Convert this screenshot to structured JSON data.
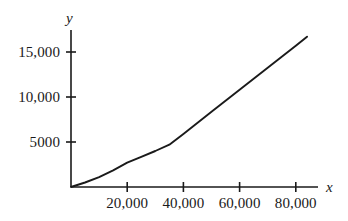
{
  "chart_data": {
    "type": "line",
    "title": "",
    "subtitle": "",
    "xlabel": "x",
    "ylabel": "y",
    "xlim": [
      0,
      88000
    ],
    "ylim": [
      0,
      18000
    ],
    "grid": false,
    "legend": null,
    "axis_labels": {
      "x": "x",
      "y": "y"
    },
    "xticks": [
      {
        "value": 20000,
        "label": "20,000"
      },
      {
        "value": 40000,
        "label": "40,000"
      },
      {
        "value": 60000,
        "label": "60,000"
      },
      {
        "value": 80000,
        "label": "80,000"
      }
    ],
    "yticks": [
      {
        "value": 5000,
        "label": "5000"
      },
      {
        "value": 10000,
        "label": "10,000"
      },
      {
        "value": 15000,
        "label": "15,000"
      }
    ],
    "series": [
      {
        "name": "y",
        "color": "#1a1a1a",
        "x": [
          0,
          5000,
          10000,
          15000,
          20000,
          25000,
          30000,
          35000,
          40000,
          50000,
          60000,
          70000,
          80000,
          84000
        ],
        "values": [
          0,
          500,
          1100,
          1850,
          2700,
          3350,
          4000,
          4700,
          5900,
          8350,
          10800,
          13250,
          15700,
          16700
        ]
      }
    ]
  },
  "axis_geometry": {
    "origin_x": 71,
    "origin_y": 187,
    "x_axis_end": 318,
    "y_axis_top": 30,
    "px_per_20000_x": 56.2,
    "px_per_5000_y": 45
  }
}
